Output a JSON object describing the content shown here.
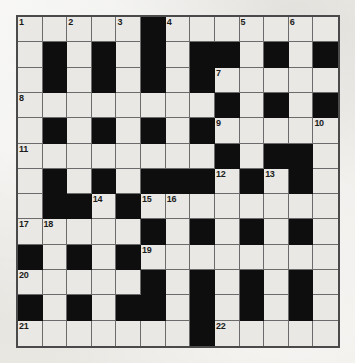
{
  "puzzle": {
    "title": "Crossword Grid",
    "type": "crossword",
    "rows": 13,
    "columns": 13,
    "colors": {
      "white_cell": "#e9e8e4",
      "black_cell": "#0e0e0e",
      "grid_line": "#6b6b6b",
      "border": "#4a4a4a",
      "paper": "#eceae6",
      "number_text": "#1b1b1b"
    },
    "legend": {
      "0": "white (fillable) cell",
      "1": "black (blocked) cell"
    },
    "grid": [
      [
        0,
        0,
        0,
        0,
        0,
        1,
        0,
        0,
        0,
        0,
        0,
        0,
        0
      ],
      [
        0,
        1,
        0,
        1,
        0,
        1,
        0,
        1,
        1,
        0,
        1,
        0,
        1
      ],
      [
        0,
        1,
        0,
        1,
        0,
        1,
        0,
        1,
        0,
        0,
        0,
        0,
        0
      ],
      [
        0,
        0,
        0,
        0,
        0,
        0,
        0,
        0,
        1,
        0,
        1,
        0,
        1
      ],
      [
        0,
        1,
        0,
        1,
        0,
        1,
        0,
        1,
        0,
        0,
        0,
        0,
        0
      ],
      [
        0,
        0,
        0,
        0,
        0,
        0,
        0,
        0,
        1,
        0,
        1,
        1,
        0
      ],
      [
        0,
        1,
        0,
        1,
        0,
        1,
        1,
        1,
        0,
        1,
        0,
        1,
        0
      ],
      [
        0,
        1,
        1,
        0,
        1,
        0,
        0,
        0,
        0,
        0,
        0,
        0,
        0
      ],
      [
        0,
        0,
        0,
        0,
        0,
        1,
        0,
        1,
        0,
        1,
        0,
        1,
        0
      ],
      [
        1,
        0,
        1,
        0,
        1,
        0,
        0,
        0,
        0,
        0,
        0,
        0,
        0
      ],
      [
        0,
        0,
        0,
        0,
        0,
        1,
        0,
        1,
        0,
        1,
        0,
        1,
        0
      ],
      [
        1,
        0,
        1,
        0,
        1,
        1,
        0,
        1,
        0,
        1,
        0,
        1,
        0
      ],
      [
        0,
        0,
        0,
        0,
        0,
        0,
        0,
        1,
        0,
        0,
        0,
        0,
        0
      ]
    ],
    "numbers": [
      {
        "row": 0,
        "col": 0,
        "label": "1"
      },
      {
        "row": 0,
        "col": 2,
        "label": "2"
      },
      {
        "row": 0,
        "col": 4,
        "label": "3"
      },
      {
        "row": 0,
        "col": 6,
        "label": "4"
      },
      {
        "row": 0,
        "col": 9,
        "label": "5"
      },
      {
        "row": 0,
        "col": 11,
        "label": "6"
      },
      {
        "row": 2,
        "col": 8,
        "label": "7"
      },
      {
        "row": 3,
        "col": 0,
        "label": "8"
      },
      {
        "row": 4,
        "col": 8,
        "label": "9"
      },
      {
        "row": 4,
        "col": 12,
        "label": "10"
      },
      {
        "row": 5,
        "col": 0,
        "label": "11"
      },
      {
        "row": 6,
        "col": 8,
        "label": "12"
      },
      {
        "row": 6,
        "col": 10,
        "label": "13"
      },
      {
        "row": 7,
        "col": 3,
        "label": "14"
      },
      {
        "row": 7,
        "col": 5,
        "label": "15"
      },
      {
        "row": 7,
        "col": 6,
        "label": "16"
      },
      {
        "row": 8,
        "col": 0,
        "label": "17"
      },
      {
        "row": 8,
        "col": 1,
        "label": "18"
      },
      {
        "row": 9,
        "col": 5,
        "label": "19"
      },
      {
        "row": 10,
        "col": 0,
        "label": "20"
      },
      {
        "row": 12,
        "col": 0,
        "label": "21"
      },
      {
        "row": 12,
        "col": 8,
        "label": "22"
      }
    ]
  }
}
